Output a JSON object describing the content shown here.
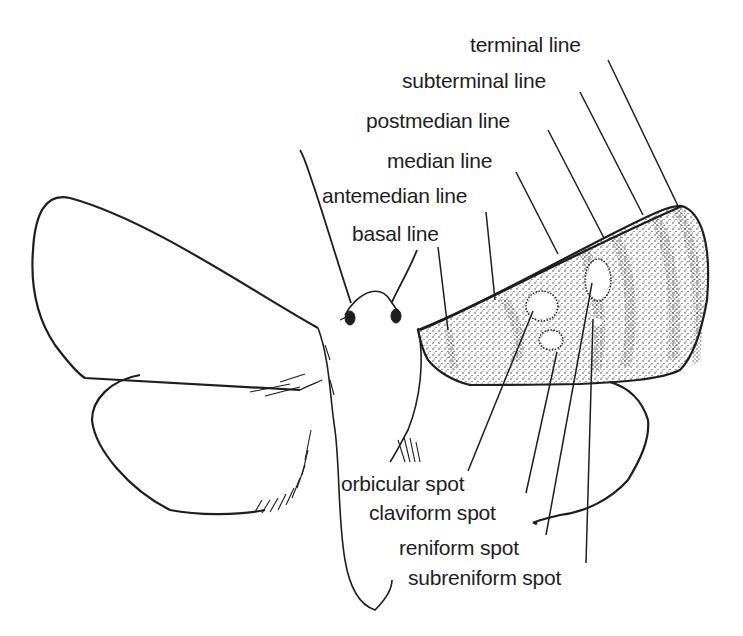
{
  "diagram": {
    "ink_color": "#1e1e1e",
    "background": "#ffffff",
    "labels": [
      {
        "id": "terminal-line",
        "text": "terminal line",
        "x": 470,
        "y": 34
      },
      {
        "id": "subterminal-line",
        "text": "subterminal line",
        "x": 402,
        "y": 70
      },
      {
        "id": "postmedian-line",
        "text": "postmedian line",
        "x": 366,
        "y": 110
      },
      {
        "id": "median-line",
        "text": "median line",
        "x": 387,
        "y": 150
      },
      {
        "id": "antemedian-line",
        "text": "antemedian line",
        "x": 322,
        "y": 185
      },
      {
        "id": "basal-line",
        "text": "basal line",
        "x": 352,
        "y": 223
      },
      {
        "id": "orbicular-spot",
        "text": "orbicular spot",
        "x": 341,
        "y": 473
      },
      {
        "id": "claviform-spot",
        "text": "claviform spot",
        "x": 369,
        "y": 502
      },
      {
        "id": "reniform-spot",
        "text": "reniform spot",
        "x": 399,
        "y": 537
      },
      {
        "id": "subreniform-spot",
        "text": "subreniform spot",
        "x": 408,
        "y": 567
      }
    ]
  }
}
